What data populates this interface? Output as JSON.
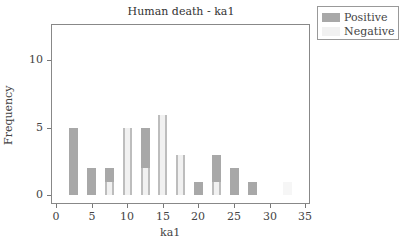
{
  "chart_data": {
    "type": "bar",
    "title": "Human death - ka1",
    "xlabel": "ka1",
    "ylabel": "Frequency",
    "xlim": [
      0,
      35
    ],
    "ylim": [
      0,
      12.5
    ],
    "xticks": [
      "0",
      "5",
      "10",
      "15",
      "20",
      "25",
      "30",
      "35"
    ],
    "yticks": [
      "0",
      "5",
      "10"
    ],
    "grid": false,
    "legend_position": "right-top",
    "categories": [
      2.5,
      5,
      7.5,
      10,
      12.5,
      15,
      17.5,
      20,
      22.5,
      25,
      27.5,
      32.5
    ],
    "series": [
      {
        "name": "Positive",
        "color": "#a8a8a8",
        "values": [
          5,
          2,
          2,
          1,
          5,
          6,
          3,
          1,
          3,
          2,
          1,
          0
        ]
      },
      {
        "name": "Negative",
        "color": "#f1f1f1",
        "values": [
          0,
          0,
          1,
          5,
          2,
          6,
          3,
          0,
          1,
          0,
          0,
          1
        ]
      }
    ]
  },
  "legend": {
    "positive": "Positive",
    "negative": "Negative"
  }
}
